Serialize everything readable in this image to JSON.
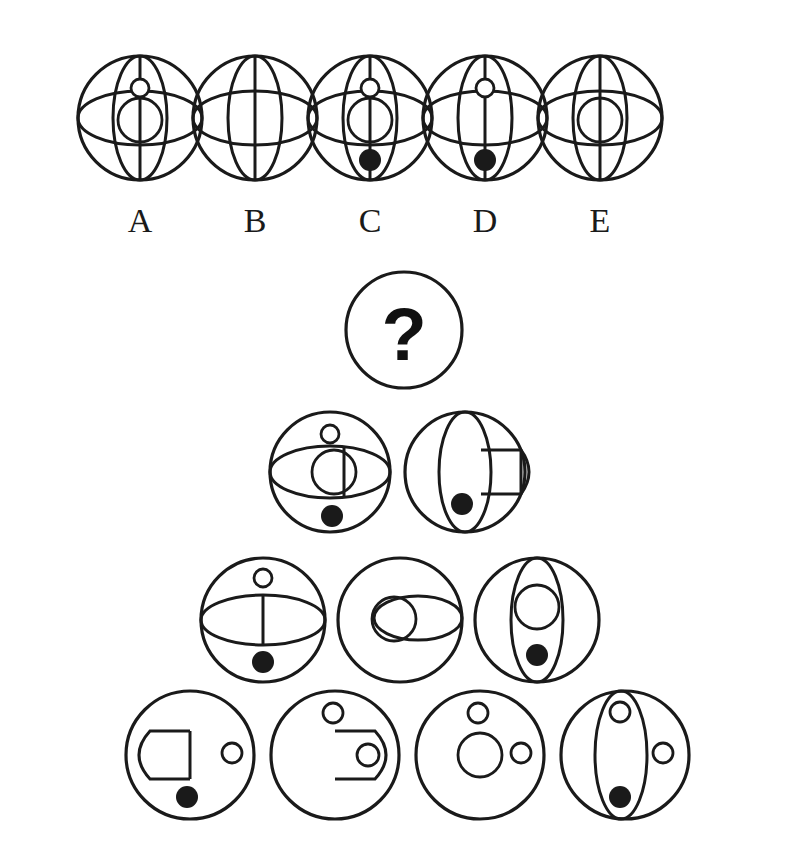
{
  "page": {
    "kind": "visual-analogy-puzzle",
    "background_color": "#ffffff",
    "ink_color": "#1a1a1a",
    "width": 803,
    "height": 853
  },
  "options": {
    "labels": [
      "A",
      "B",
      "C",
      "D",
      "E"
    ],
    "label_y": 224,
    "centers_x": [
      140,
      255,
      370,
      485,
      600
    ],
    "center_y": 118,
    "radius": 62,
    "items": [
      {
        "label": "A",
        "features": [
          "outer-circle",
          "vertical-ellipse",
          "horizontal-ellipse",
          "vertical-line",
          "small-circle-top",
          "medium-circle-center"
        ]
      },
      {
        "label": "B",
        "features": [
          "outer-circle",
          "vertical-ellipse",
          "horizontal-ellipse",
          "vertical-line"
        ]
      },
      {
        "label": "C",
        "features": [
          "outer-circle",
          "vertical-ellipse",
          "horizontal-ellipse",
          "vertical-line",
          "small-circle-top",
          "medium-circle-center",
          "filled-dot-bottom"
        ]
      },
      {
        "label": "D",
        "features": [
          "outer-circle",
          "vertical-ellipse",
          "horizontal-ellipse",
          "vertical-line",
          "small-circle-top",
          "filled-dot-bottom"
        ]
      },
      {
        "label": "E",
        "features": [
          "outer-circle",
          "vertical-ellipse",
          "horizontal-ellipse",
          "vertical-line",
          "medium-circle-center"
        ]
      }
    ]
  },
  "pyramid": {
    "apex": {
      "symbol": "?",
      "cx": 404,
      "cy": 330,
      "r": 58,
      "features": [
        "outer-circle",
        "question-mark"
      ]
    },
    "rows": [
      {
        "row": 2,
        "cy": 472,
        "r": 60,
        "items": [
          {
            "cx": 330,
            "features": [
              "outer-circle",
              "horizontal-ellipse",
              "vertical-line",
              "small-circle-top",
              "medium-circle-center",
              "filled-dot-bottom"
            ]
          },
          {
            "cx": 465,
            "features": [
              "outer-circle",
              "vertical-ellipse",
              "right-lens",
              "filled-dot-bottom"
            ]
          }
        ]
      },
      {
        "row": 3,
        "cy": 620,
        "r": 62,
        "items": [
          {
            "cx": 263,
            "features": [
              "outer-circle",
              "horizontal-ellipse",
              "vertical-line",
              "small-circle-top",
              "filled-dot-bottom"
            ]
          },
          {
            "cx": 400,
            "features": [
              "outer-circle",
              "right-horizontal-ellipse",
              "medium-circle-left"
            ]
          },
          {
            "cx": 537,
            "features": [
              "outer-circle",
              "vertical-ellipse",
              "medium-circle-center",
              "filled-dot-bottom"
            ]
          }
        ]
      },
      {
        "row": 4,
        "cy": 755,
        "r": 64,
        "items": [
          {
            "cx": 190,
            "features": [
              "outer-circle",
              "left-wedge",
              "small-circle-right",
              "filled-dot-bottom"
            ]
          },
          {
            "cx": 335,
            "features": [
              "outer-circle",
              "right-lens",
              "small-circle-top",
              "small-circle-in-lens"
            ]
          },
          {
            "cx": 480,
            "features": [
              "outer-circle",
              "small-circle-top",
              "medium-circle-center",
              "small-circle-right"
            ]
          },
          {
            "cx": 625,
            "features": [
              "outer-circle",
              "vertical-ellipse",
              "small-circle-top",
              "small-circle-right",
              "filled-dot-bottom"
            ]
          }
        ]
      }
    ]
  },
  "style": {
    "stroke_width_outer": 3.2,
    "stroke_width_inner": 2.8,
    "small_circle_r": 9,
    "medium_circle_r": 22,
    "dot_r": 11
  }
}
